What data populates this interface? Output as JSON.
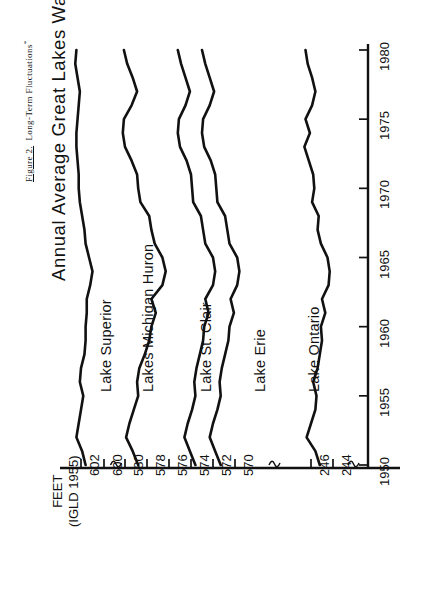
{
  "caption": {
    "figure_number": "Figure 2.",
    "text": "Long-Term Fluctuations",
    "footnote_marker": "*"
  },
  "title": "Annual Average Great Lakes Water Levels",
  "axis_label": {
    "line1": "FEET",
    "line2": "(IGLD 1955)"
  },
  "colors": {
    "line": "#111111",
    "axis": "#111111",
    "background": "#ffffff"
  },
  "value_axis": {
    "ticks": [
      "602",
      "600",
      "580",
      "578",
      "576",
      "574",
      "572",
      "570",
      "246",
      "244"
    ],
    "breaks": 3
  },
  "time_axis": {
    "ticks": [
      "1950",
      "1955",
      "1960",
      "1965",
      "1970",
      "1975",
      "1980"
    ]
  },
  "series_labels": [
    "Lake Superior",
    "Lakes Michigan Huron",
    "Lake St. Clair",
    "Lake Erie",
    "Lake Ontario"
  ],
  "chart_data": {
    "type": "line",
    "title": "Annual Average Great Lakes Water Levels",
    "xlabel": "FEET (IGLD 1955)",
    "ylabel": "",
    "orientation": "rotated-90ccw",
    "note": "Value axis is horizontal and broken into three panels; time axis is vertical running 1950 (bottom) to 1980 (top).",
    "grid": false,
    "legend": "inline-series-labels",
    "x": [
      1950,
      1951,
      1952,
      1953,
      1954,
      1955,
      1956,
      1957,
      1958,
      1959,
      1960,
      1961,
      1962,
      1963,
      1964,
      1965,
      1966,
      1967,
      1968,
      1969,
      1970,
      1971,
      1972,
      1973,
      1974,
      1975,
      1976,
      1977,
      1978,
      1979,
      1980
    ],
    "value_axis_ticks": [
      602,
      600,
      580,
      578,
      576,
      574,
      572,
      570,
      246,
      244
    ],
    "time_axis_ticks": [
      1950,
      1955,
      1960,
      1965,
      1970,
      1975,
      1980
    ],
    "series": [
      {
        "name": "Lake Superior",
        "units": "feet (IGLD 1955)",
        "values": [
          601.6,
          601.9,
          602.4,
          602.2,
          602.0,
          601.8,
          602.1,
          602.0,
          601.7,
          601.6,
          601.6,
          601.5,
          601.5,
          601.2,
          601.0,
          601.3,
          601.6,
          601.7,
          601.9,
          602.1,
          602.2,
          602.2,
          602.3,
          602.4,
          602.4,
          602.3,
          602.2,
          602.1,
          602.3,
          602.5,
          602.4
        ]
      },
      {
        "name": "Lakes Michigan Huron",
        "units": "feet (IGLD 1955)",
        "values": [
          578.8,
          579.3,
          579.9,
          579.6,
          579.2,
          578.8,
          578.9,
          578.7,
          578.2,
          577.8,
          577.6,
          577.2,
          577.6,
          576.6,
          576.3,
          576.6,
          577.3,
          577.6,
          577.8,
          578.6,
          578.8,
          578.9,
          579.4,
          580.0,
          580.2,
          580.1,
          579.4,
          578.9,
          579.3,
          579.8,
          580.1
        ]
      },
      {
        "name": "Lake St. Clair",
        "units": "feet (IGLD 1955)",
        "values": [
          573.6,
          574.1,
          574.6,
          574.3,
          573.9,
          573.6,
          573.7,
          573.5,
          573.2,
          572.9,
          572.8,
          572.4,
          572.7,
          572.0,
          571.8,
          572.0,
          572.7,
          572.9,
          573.1,
          573.8,
          573.9,
          574.0,
          574.4,
          575.0,
          575.2,
          575.1,
          574.5,
          574.1,
          574.5,
          574.9,
          575.2
        ]
      },
      {
        "name": "Lake Erie",
        "units": "feet (IGLD 1955)",
        "values": [
          571.3,
          571.8,
          572.3,
          572.0,
          571.6,
          571.3,
          571.4,
          571.2,
          570.9,
          570.6,
          570.5,
          570.1,
          570.4,
          569.8,
          569.6,
          569.8,
          570.5,
          570.7,
          570.9,
          571.6,
          571.7,
          571.8,
          572.2,
          572.8,
          573.0,
          572.9,
          572.3,
          571.9,
          572.3,
          572.7,
          573.0
        ]
      },
      {
        "name": "Lake Ontario",
        "units": "feet (IGLD 1955)",
        "values": [
          245.2,
          245.6,
          246.4,
          246.0,
          245.6,
          245.5,
          245.8,
          245.4,
          245.2,
          245.0,
          245.1,
          244.7,
          245.0,
          244.4,
          244.3,
          244.5,
          245.1,
          245.4,
          245.3,
          245.9,
          245.7,
          245.8,
          246.2,
          246.6,
          246.1,
          246.5,
          245.9,
          245.6,
          245.9,
          246.3,
          246.5
        ]
      }
    ]
  }
}
